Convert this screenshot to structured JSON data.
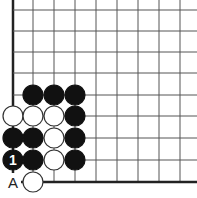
{
  "board": {
    "grid": {
      "x_lines": [
        13,
        33,
        54,
        75,
        96,
        117,
        138,
        159,
        180
      ],
      "y_lines": [
        10,
        31,
        52,
        73,
        95,
        116,
        138,
        160,
        182
      ],
      "line_color": "#555555",
      "edge_color": "#222222"
    },
    "stones": [
      {
        "col": 1,
        "row": 4,
        "color": "black"
      },
      {
        "col": 2,
        "row": 4,
        "color": "black"
      },
      {
        "col": 3,
        "row": 4,
        "color": "black"
      },
      {
        "col": 0,
        "row": 5,
        "color": "white"
      },
      {
        "col": 1,
        "row": 5,
        "color": "white"
      },
      {
        "col": 2,
        "row": 5,
        "color": "white"
      },
      {
        "col": 3,
        "row": 5,
        "color": "black"
      },
      {
        "col": 0,
        "row": 6,
        "color": "black"
      },
      {
        "col": 1,
        "row": 6,
        "color": "black"
      },
      {
        "col": 2,
        "row": 6,
        "color": "white"
      },
      {
        "col": 3,
        "row": 6,
        "color": "black"
      },
      {
        "col": 0,
        "row": 7,
        "color": "black",
        "label": "1"
      },
      {
        "col": 1,
        "row": 7,
        "color": "black"
      },
      {
        "col": 2,
        "row": 7,
        "color": "white"
      },
      {
        "col": 3,
        "row": 7,
        "color": "black"
      },
      {
        "col": 1,
        "row": 8,
        "color": "white"
      }
    ],
    "markers": [
      {
        "col": 0,
        "row": 8,
        "label": "A"
      }
    ]
  }
}
